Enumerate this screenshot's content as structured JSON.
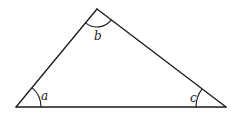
{
  "diagram": {
    "type": "triangle",
    "vertices": {
      "A": {
        "x": 16,
        "y": 107
      },
      "B": {
        "x": 97,
        "y": 9
      },
      "C": {
        "x": 226,
        "y": 107
      }
    },
    "angles": [
      {
        "vertex": "A",
        "label": "a",
        "label_x": 41,
        "label_y": 100
      },
      {
        "vertex": "B",
        "label": "b",
        "label_x": 94,
        "label_y": 40
      },
      {
        "vertex": "C",
        "label": "c",
        "label_x": 190,
        "label_y": 102
      }
    ],
    "colors": {
      "stroke": "#1a1a1a",
      "background": "#ffffff"
    }
  }
}
